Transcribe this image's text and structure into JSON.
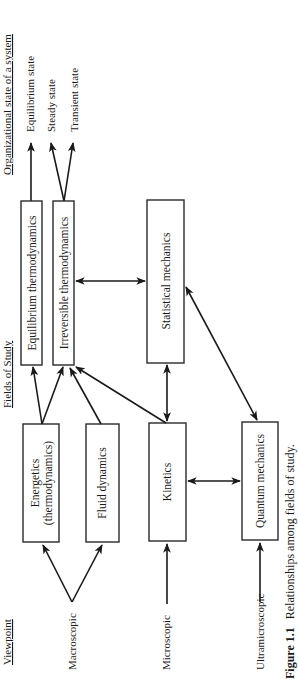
{
  "headers": {
    "viewpoint": "Viewpoint",
    "fields_of_study": "Fields of Study",
    "organizational_state": "Organizational state of a system"
  },
  "viewpoints": [
    {
      "id": "macroscopic",
      "label": "Macroscopic"
    },
    {
      "id": "microscopic",
      "label": "Microscopic"
    },
    {
      "id": "ultramicroscopic",
      "label": "Ultramicroscopic"
    }
  ],
  "fields": {
    "energetics": {
      "line1": "Energetics",
      "line2": "(thermodynamics)"
    },
    "fluid_dynamics": {
      "label": "Fluid dynamics"
    },
    "kinetics": {
      "label": "Kinetics"
    },
    "quantum_mechanics": {
      "label": "Quantum mechanics"
    },
    "equilibrium_thermodynamics": {
      "label": "Equilibrium thermodynamics"
    },
    "irreversible_thermodynamics": {
      "label": "Irreversible thermodynamics"
    },
    "statistical_mechanics": {
      "label": "Statistical mechanics"
    }
  },
  "states": [
    {
      "id": "equilibrium",
      "label": "Equilibrium state"
    },
    {
      "id": "steady",
      "label": "Steady state"
    },
    {
      "id": "transient",
      "label": "Transient state"
    }
  ],
  "caption": {
    "figure_number": "Figure 1.1",
    "text": "Relationships among fields of study."
  },
  "relationships": [
    {
      "from": "Macroscopic",
      "to": "Energetics (thermodynamics)",
      "type": "directed"
    },
    {
      "from": "Macroscopic",
      "to": "Fluid dynamics",
      "type": "directed"
    },
    {
      "from": "Microscopic",
      "to": "Kinetics",
      "type": "directed"
    },
    {
      "from": "Ultramicroscopic",
      "to": "Quantum mechanics",
      "type": "directed"
    },
    {
      "from": "Energetics (thermodynamics)",
      "to": "Equilibrium thermodynamics",
      "type": "directed"
    },
    {
      "from": "Energetics (thermodynamics)",
      "to": "Irreversible thermodynamics",
      "type": "directed"
    },
    {
      "from": "Fluid dynamics",
      "to": "Irreversible thermodynamics",
      "type": "directed"
    },
    {
      "from": "Kinetics",
      "to": "Irreversible thermodynamics",
      "type": "directed"
    },
    {
      "from": "Kinetics",
      "to": "Statistical mechanics",
      "type": "bidirectional"
    },
    {
      "from": "Kinetics",
      "to": "Quantum mechanics",
      "type": "bidirectional"
    },
    {
      "from": "Quantum mechanics",
      "to": "Statistical mechanics",
      "type": "bidirectional"
    },
    {
      "from": "Irreversible thermodynamics",
      "to": "Statistical mechanics",
      "type": "bidirectional"
    },
    {
      "from": "Equilibrium thermodynamics",
      "to": "Equilibrium state",
      "type": "directed"
    },
    {
      "from": "Irreversible thermodynamics",
      "to": "Steady state",
      "type": "directed"
    },
    {
      "from": "Irreversible thermodynamics",
      "to": "Transient state",
      "type": "directed"
    }
  ]
}
